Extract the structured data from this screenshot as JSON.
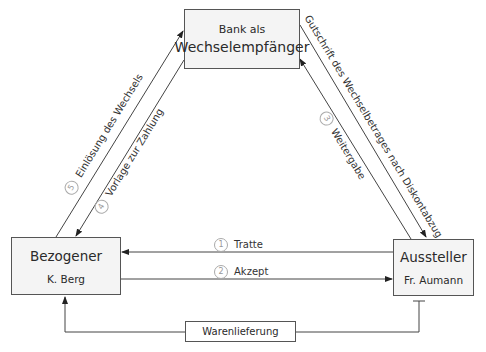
{
  "bank": {
    "line1": "Bank als",
    "line2": "Wechselempfänger"
  },
  "bezogener": {
    "name": "Bezogener",
    "person": "K. Berg"
  },
  "aussteller": {
    "name": "Aussteller",
    "person": "Fr. Aumann"
  },
  "flows": [
    {
      "num": "1",
      "label": "Tratte",
      "direction": "Aussteller → Bezogener"
    },
    {
      "num": "2",
      "label": "Akzept",
      "direction": "Bezogener → Aussteller"
    },
    {
      "num": "3",
      "label": "Weitergabe",
      "direction": "Aussteller → Bank"
    },
    {
      "num": "4",
      "label": "Vorlage zur Zahlung",
      "direction": "Bank → Bezogener"
    },
    {
      "num": "5",
      "label": "Einlösung des Wechsels",
      "direction": "Bezogener → Bank"
    }
  ],
  "gutschrift": "Gutschrift des Wechselbetrages nach Diskontabzug",
  "warenlieferung": "Warenlieferung",
  "colors": {
    "line": "#444444",
    "box_fill": "#f4f4f4",
    "circle": "#aaaaaa"
  }
}
